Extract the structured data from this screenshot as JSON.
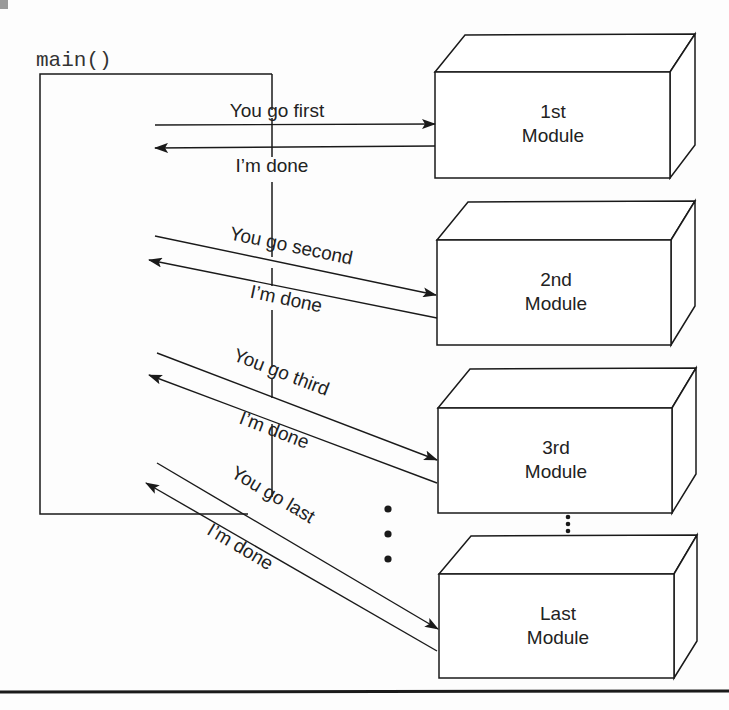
{
  "main_function": {
    "label": "main()"
  },
  "colors": {
    "ink": "#1a1a1a",
    "background": "#fdfdfd",
    "scan_mark": "#9a9a9a"
  },
  "modules": [
    {
      "line1": "1st",
      "line2": "Module"
    },
    {
      "line1": "2nd",
      "line2": "Module"
    },
    {
      "line1": "3rd",
      "line2": "Module"
    },
    {
      "line1": "Last",
      "line2": "Module"
    }
  ],
  "calls": [
    {
      "request": "You go first",
      "reply": "I’m done"
    },
    {
      "request": "You go second",
      "reply": "I’m done"
    },
    {
      "request": "You go third",
      "reply": "I’m done"
    },
    {
      "request": "You go last",
      "reply": "I’m done"
    }
  ],
  "ellipsis": {
    "between_calls": "⋮",
    "between_modules": "⋮"
  }
}
